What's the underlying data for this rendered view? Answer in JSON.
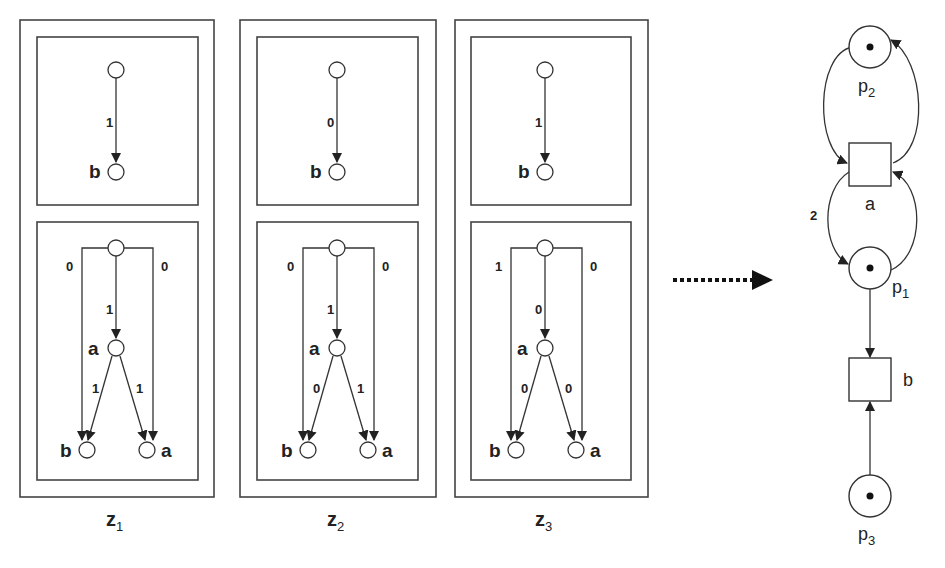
{
  "diagram": {
    "type": "petri-net-unfolding-to-net",
    "zones": [
      {
        "label_main": "z",
        "label_sub": "1",
        "top_tree": {
          "edge_weight": "1",
          "leaf_label": "b"
        },
        "bottom_tree": {
          "left_branch_weight": "0",
          "right_branch_weight": "0",
          "center_weight": "1",
          "mid_label": "a",
          "mid_left_weight": "1",
          "mid_right_weight": "1",
          "leaf_left_label": "b",
          "leaf_right_label": "a"
        }
      },
      {
        "label_main": "z",
        "label_sub": "2",
        "top_tree": {
          "edge_weight": "0",
          "leaf_label": "b"
        },
        "bottom_tree": {
          "left_branch_weight": "0",
          "right_branch_weight": "0",
          "center_weight": "1",
          "mid_label": "a",
          "mid_left_weight": "0",
          "mid_right_weight": "1",
          "leaf_left_label": "b",
          "leaf_right_label": "a"
        }
      },
      {
        "label_main": "z",
        "label_sub": "3",
        "top_tree": {
          "edge_weight": "1",
          "leaf_label": "b"
        },
        "bottom_tree": {
          "left_branch_weight": "1",
          "right_branch_weight": "0",
          "center_weight": "0",
          "mid_label": "a",
          "mid_left_weight": "0",
          "mid_right_weight": "0",
          "leaf_left_label": "b",
          "leaf_right_label": "a"
        }
      }
    ],
    "arrow": {
      "style": "dotted",
      "direction": "right"
    },
    "petri_net": {
      "places": [
        {
          "id": "p2",
          "main": "p",
          "sub": "2",
          "tokens": 1
        },
        {
          "id": "p1",
          "main": "p",
          "sub": "1",
          "tokens": 1
        },
        {
          "id": "p3",
          "main": "p",
          "sub": "3",
          "tokens": 1
        }
      ],
      "transitions": [
        {
          "id": "a",
          "label": "a"
        },
        {
          "id": "b",
          "label": "b"
        }
      ],
      "arcs": [
        {
          "from": "p2",
          "to": "a",
          "weight": ""
        },
        {
          "from": "a",
          "to": "p2",
          "weight": ""
        },
        {
          "from": "a",
          "to": "p1",
          "weight": "2"
        },
        {
          "from": "p1",
          "to": "a",
          "weight": ""
        },
        {
          "from": "p1",
          "to": "b",
          "weight": ""
        },
        {
          "from": "p3",
          "to": "b",
          "weight": ""
        }
      ]
    }
  }
}
